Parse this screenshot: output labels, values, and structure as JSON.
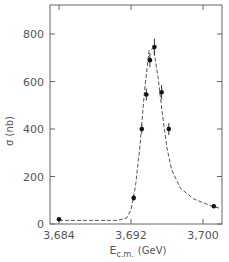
{
  "chart_data": {
    "type": "scatter",
    "title": "",
    "xlabel": "E_c.m. (GeV)",
    "xlabel_main": "E",
    "xlabel_sub": "c.m.",
    "xlabel_unit": "(GeV)",
    "ylabel": "σ (nb)",
    "xlim": [
      3.6832,
      3.7022
    ],
    "ylim": [
      0,
      900
    ],
    "xticks": [
      3.684,
      3.692,
      3.7
    ],
    "xtick_labels": [
      "3,684",
      "3,692",
      "3,700"
    ],
    "yticks": [
      0,
      200,
      400,
      600,
      800
    ],
    "ytick_labels": [
      "0",
      "200",
      "400",
      "600",
      "800"
    ],
    "grid": false,
    "legend": null,
    "series": [
      {
        "name": "measured cross section",
        "style": "points with error bars",
        "x": [
          3.684,
          3.6923,
          3.6932,
          3.6937,
          3.6941,
          3.6946,
          3.6954,
          3.6962,
          3.7012
        ],
        "y": [
          20,
          110,
          400,
          545,
          690,
          745,
          555,
          400,
          75
        ],
        "yerr": [
          5,
          12,
          20,
          25,
          30,
          35,
          30,
          25,
          8
        ]
      },
      {
        "name": "fit curve",
        "style": "dashed line",
        "x": [
          3.684,
          3.688,
          3.6905,
          3.6915,
          3.692,
          3.6925,
          3.693,
          3.6935,
          3.694,
          3.6945,
          3.695,
          3.6955,
          3.696,
          3.6965,
          3.6975,
          3.699,
          3.701,
          3.702
        ],
        "y": [
          15,
          15,
          15,
          25,
          60,
          160,
          330,
          560,
          730,
          740,
          620,
          460,
          320,
          230,
          150,
          105,
          75,
          65
        ]
      }
    ]
  },
  "axes": {
    "y_title": "σ (nb)",
    "x_title_main": "E",
    "x_title_sub": "c.m.",
    "x_title_unit": "(GeV)"
  }
}
